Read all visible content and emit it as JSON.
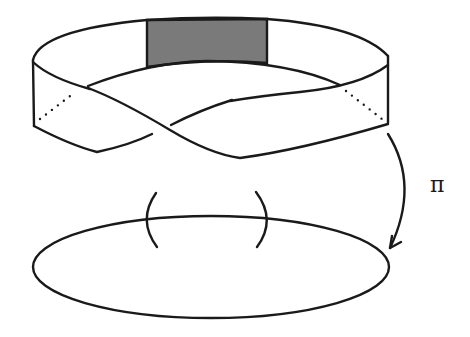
{
  "figure": {
    "map_label": "π",
    "colors": {
      "line": "#1a1a1a",
      "shaded_patch": "#7a7a7a",
      "background": "#ffffff"
    },
    "elements": {
      "total_space": "mobius-band",
      "shaded_region": "local-trivialization-patch",
      "base_space": "circle",
      "base_interval_marks": [
        "(",
        ")"
      ],
      "projection_arrow": "curved-arrow"
    }
  }
}
